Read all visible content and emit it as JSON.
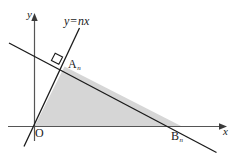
{
  "figure": {
    "background_color": "#ffffff",
    "stroke_color": "#1a1a1a",
    "shade_color": "#d6d6d6",
    "axes": {
      "x_label": "x",
      "y_label": "y",
      "origin_label": "O",
      "x_axis_name": "x-axis",
      "y_axis_name": "y-axis"
    },
    "labels": {
      "line_equation": "y",
      "line_equation_sign": "=",
      "line_equation_rhs": "nx",
      "point_a": "A",
      "point_a_sub": "n",
      "point_b": "B",
      "point_b_sub": "n"
    },
    "markers": {
      "right_angle": "right-angle-mark"
    },
    "geometry": {
      "x_axis": {
        "x1": 8,
        "y1": 126.5,
        "x2": 227,
        "y2": 126.5
      },
      "y_axis": {
        "x1": 34.5,
        "y1": 140,
        "x2": 34.5,
        "y2": 14
      },
      "line_nx": {
        "x1": 24,
        "y1": 146,
        "x2": 79,
        "y2": 29
      },
      "line_slant": {
        "x1": 9,
        "y1": 43,
        "x2": 216,
        "y2": 152
      },
      "triangle": [
        {
          "x": 34.5,
          "y": 126.5
        },
        {
          "x": 64.5,
          "y": 66.5
        },
        {
          "x": 182,
          "y": 126.5
        }
      ],
      "point_a": {
        "x": 64.5,
        "y": 66.5
      },
      "point_b": {
        "x": 182,
        "y": 126.5
      },
      "origin": {
        "x": 34.5,
        "y": 126.5
      }
    }
  }
}
